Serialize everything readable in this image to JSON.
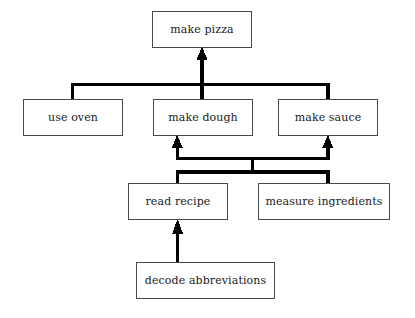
{
  "diagram": {
    "type": "hierarchical-task-analysis",
    "title": "",
    "background_color": "#ffffff",
    "box_fill_color": "#ffffff",
    "box_border_color": "#4a4a4a",
    "connector_color": "#000000",
    "text_color": "#1b1b1b",
    "nodes": [
      {
        "id": "make-pizza",
        "label": "make pizza",
        "level": 0,
        "x": 152,
        "y": 11,
        "w": 100,
        "h": 37
      },
      {
        "id": "use-oven",
        "label": "use oven",
        "level": 1,
        "x": 23,
        "y": 99,
        "w": 100,
        "h": 37
      },
      {
        "id": "make-dough",
        "label": "make dough",
        "level": 1,
        "x": 153,
        "y": 99,
        "w": 100,
        "h": 37
      },
      {
        "id": "make-sauce",
        "label": "make sauce",
        "level": 1,
        "x": 278,
        "y": 99,
        "w": 100,
        "h": 37
      },
      {
        "id": "read-recipe",
        "label": "read recipe",
        "level": 2,
        "x": 128,
        "y": 183,
        "w": 100,
        "h": 37
      },
      {
        "id": "measure-ingredients",
        "label": "measure ingredients",
        "level": 2,
        "x": 258,
        "y": 183,
        "w": 132,
        "h": 37
      },
      {
        "id": "decode-abbreviations",
        "label": "decode abbreviations",
        "level": 3,
        "x": 136,
        "y": 262,
        "w": 139,
        "h": 37
      }
    ],
    "edges": [
      {
        "from": "use-oven",
        "to": "make-pizza",
        "style": "bus"
      },
      {
        "from": "make-dough",
        "to": "make-pizza",
        "style": "bus-arrow"
      },
      {
        "from": "make-sauce",
        "to": "make-pizza",
        "style": "bus"
      },
      {
        "from": "read-recipe",
        "to": "make-dough",
        "style": "bus-arrow"
      },
      {
        "from": "read-recipe",
        "to": "make-sauce",
        "style": "bus-arrow"
      },
      {
        "from": "measure-ingredients",
        "to": "make-dough",
        "style": "bus-arrow"
      },
      {
        "from": "measure-ingredients",
        "to": "make-sauce",
        "style": "bus-arrow"
      },
      {
        "from": "decode-abbreviations",
        "to": "read-recipe",
        "style": "arrow"
      }
    ]
  }
}
